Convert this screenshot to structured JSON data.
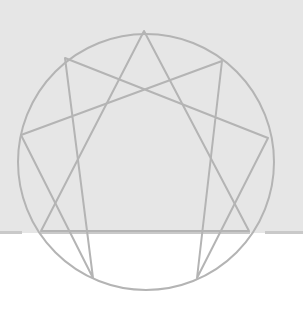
{
  "diagram": {
    "type": "enneagram",
    "colors": {
      "background_band": "#e6e6e6",
      "page": "#ffffff",
      "stroke": "#b4b4b4",
      "band_edge": "#c9c9c9"
    },
    "circle": {
      "cx": 146,
      "cy": 162,
      "r": 128
    },
    "points": [
      {
        "id": "9",
        "x": 144,
        "y": 31
      },
      {
        "id": "1",
        "x": 222,
        "y": 61
      },
      {
        "id": "2",
        "x": 268,
        "y": 138
      },
      {
        "id": "3",
        "x": 249,
        "y": 231
      },
      {
        "id": "4",
        "x": 197,
        "y": 278
      },
      {
        "id": "5",
        "x": 93,
        "y": 278
      },
      {
        "id": "6",
        "x": 41,
        "y": 231
      },
      {
        "id": "7",
        "x": 21,
        "y": 135
      },
      {
        "id": "8",
        "x": 65,
        "y": 58
      }
    ],
    "triangle": [
      "9",
      "3",
      "6"
    ],
    "hexad": [
      "1",
      "4",
      "2",
      "8",
      "5",
      "7"
    ]
  }
}
